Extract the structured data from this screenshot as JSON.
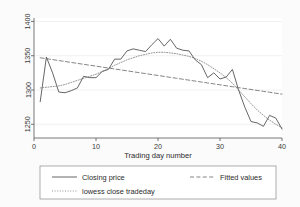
{
  "chart_data": {
    "type": "line",
    "title": "",
    "xlabel": "Trading day number",
    "ylabel": "",
    "xlim": [
      0,
      40
    ],
    "ylim": [
      1230,
      1405
    ],
    "xticks": [
      0,
      10,
      20,
      30,
      40
    ],
    "yticks": [
      1250,
      1300,
      1350,
      1400
    ],
    "xtick_labels": [
      "0",
      "10",
      "20",
      "30",
      "40"
    ],
    "ytick_labels": [
      "1250",
      "1300",
      "1350",
      "1400"
    ],
    "grid": "horizontal-light",
    "legend_position": "below-plot",
    "x": [
      1,
      2,
      3,
      4,
      5,
      6,
      7,
      8,
      9,
      10,
      11,
      12,
      13,
      14,
      15,
      16,
      17,
      18,
      19,
      20,
      21,
      22,
      23,
      24,
      25,
      26,
      27,
      28,
      29,
      30,
      31,
      32,
      33,
      34,
      35,
      36,
      37,
      38,
      39,
      40
    ],
    "series": [
      {
        "name": "Closing price",
        "style": "solid",
        "color": "#555555",
        "values": [
          1283,
          1348,
          1325,
          1297,
          1296,
          1299,
          1303,
          1320,
          1318,
          1318,
          1327,
          1330,
          1345,
          1345,
          1357,
          1360,
          1358,
          1356,
          1366,
          1375,
          1364,
          1374,
          1361,
          1358,
          1357,
          1344,
          1337,
          1318,
          1325,
          1316,
          1319,
          1330,
          1300,
          1275,
          1254,
          1252,
          1247,
          1263,
          1259,
          1243
        ]
      },
      {
        "name": "Fitted values",
        "style": "dashed",
        "color": "#666666",
        "values": [
          1347,
          1345.6,
          1344.3,
          1342.9,
          1341.6,
          1340.2,
          1338.8,
          1337.5,
          1336.1,
          1334.8,
          1333.4,
          1332,
          1330.7,
          1329.3,
          1328,
          1326.6,
          1325.2,
          1323.9,
          1322.5,
          1321.2,
          1319.8,
          1318.4,
          1317.1,
          1315.7,
          1314.4,
          1313,
          1311.6,
          1310.3,
          1308.9,
          1307.6,
          1306.2,
          1304.8,
          1303.5,
          1302.1,
          1300.8,
          1299.4,
          1298,
          1296.7,
          1295.3,
          1294
        ]
      },
      {
        "name": "lowess close  tradeday",
        "style": "dotted",
        "color": "#777777",
        "values": [
          1303,
          1304,
          1305,
          1306,
          1308,
          1311,
          1314,
          1317,
          1320,
          1323,
          1327,
          1331,
          1336,
          1340,
          1344,
          1347,
          1350,
          1352,
          1354,
          1355,
          1355,
          1354,
          1353,
          1351,
          1349,
          1346,
          1342,
          1337,
          1331,
          1325,
          1318,
          1310,
          1300,
          1290,
          1280,
          1271,
          1263,
          1256,
          1250,
          1245
        ]
      }
    ]
  },
  "legend": {
    "items": [
      {
        "label": "Closing price",
        "style": "solid"
      },
      {
        "label": "Fitted values",
        "style": "dashed"
      },
      {
        "label": "lowess close  tradeday",
        "style": "dotted"
      }
    ]
  },
  "colors": {
    "background": "#fbfbfb",
    "plot_background": "#ffffff",
    "axis": "#555555",
    "text": "#2b2b2b",
    "gridline": "#e8e8e8",
    "legend_border": "#8a8a8a"
  }
}
